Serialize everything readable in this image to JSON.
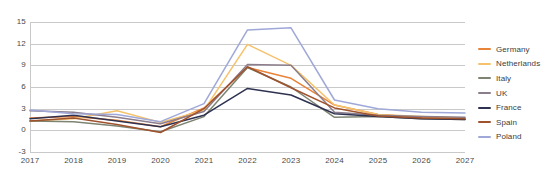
{
  "chart_data": {
    "type": "line",
    "title": "",
    "subtitle": "",
    "xlabel": "",
    "ylabel": "",
    "categories": [
      "2017",
      "2018",
      "2019",
      "2020",
      "2021",
      "2022",
      "2023",
      "2024",
      "2025",
      "2026",
      "2027"
    ],
    "x_tick_labels": [
      "2017",
      "2018",
      "2019",
      "2020",
      "2021",
      "2022",
      "2023",
      "2024",
      "2025",
      "2026",
      "2027"
    ],
    "y_tick_labels": [
      "15",
      "12",
      "9",
      "6",
      "3",
      "0",
      "-3"
    ],
    "y_ticks": [
      15,
      12,
      9,
      6,
      3,
      0,
      -3
    ],
    "ylim": [
      -3,
      15
    ],
    "grid": "horizontal",
    "legend_position": "right",
    "series": [
      {
        "name": "Germany",
        "color": "#E8833A",
        "values": [
          1.7,
          1.9,
          1.4,
          0.5,
          3.1,
          8.7,
          7.2,
          3.5,
          2.2,
          1.8,
          1.7
        ]
      },
      {
        "name": "Netherlands",
        "color": "#F5C26B",
        "values": [
          1.3,
          1.6,
          2.7,
          1.1,
          2.8,
          11.9,
          9.0,
          3.5,
          2.2,
          1.9,
          1.7
        ]
      },
      {
        "name": "Italy",
        "color": "#7D8471",
        "values": [
          1.3,
          1.2,
          0.6,
          -0.2,
          1.9,
          8.7,
          6.0,
          1.8,
          1.9,
          1.6,
          1.5
        ]
      },
      {
        "name": "UK",
        "color": "#8B7D8B",
        "values": [
          2.7,
          2.5,
          1.8,
          0.9,
          2.6,
          9.1,
          9.0,
          2.5,
          2.1,
          1.9,
          1.8
        ]
      },
      {
        "name": "France",
        "color": "#2E3250",
        "values": [
          1.6,
          2.1,
          1.3,
          0.5,
          2.1,
          5.8,
          4.9,
          2.3,
          1.9,
          1.6,
          1.5
        ]
      },
      {
        "name": "Spain",
        "color": "#A0522D",
        "values": [
          1.3,
          1.7,
          0.8,
          -0.3,
          3.0,
          8.8,
          5.9,
          3.1,
          2.0,
          1.7,
          1.6
        ]
      },
      {
        "name": "Poland",
        "color": "#9FA8D8",
        "values": [
          2.8,
          2.3,
          2.2,
          1.2,
          3.7,
          13.9,
          14.2,
          4.2,
          3.0,
          2.5,
          2.4
        ]
      }
    ]
  },
  "legend": {
    "items": [
      {
        "label": "Germany",
        "color": "#E8833A"
      },
      {
        "label": "Netherlands",
        "color": "#F5C26B"
      },
      {
        "label": "Italy",
        "color": "#7D8471"
      },
      {
        "label": "UK",
        "color": "#8B7D8B"
      },
      {
        "label": "France",
        "color": "#2E3250"
      },
      {
        "label": "Spain",
        "color": "#A0522D"
      },
      {
        "label": "Poland",
        "color": "#9FA8D8"
      }
    ]
  }
}
